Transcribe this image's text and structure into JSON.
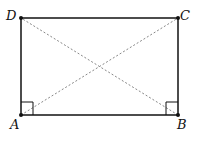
{
  "diagram": {
    "type": "rectangle-with-diagonals",
    "points": {
      "A": {
        "label": "A",
        "x": 21,
        "y": 115
      },
      "B": {
        "label": "B",
        "x": 178,
        "y": 115
      },
      "C": {
        "label": "C",
        "x": 178,
        "y": 18
      },
      "D": {
        "label": "D",
        "x": 21,
        "y": 18
      }
    },
    "edges": [
      "AB",
      "BC",
      "CD",
      "DA"
    ],
    "diagonals": [
      "AC",
      "BD"
    ],
    "diagonal_style": "dashed",
    "right_angle_marks": [
      "A",
      "B"
    ],
    "colors": {
      "line": "#111111",
      "diagonal": "#888888"
    }
  }
}
